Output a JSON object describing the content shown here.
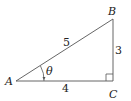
{
  "diagram": {
    "type": "right-triangle",
    "vertices": {
      "A": {
        "label": "A"
      },
      "B": {
        "label": "B"
      },
      "C": {
        "label": "C"
      }
    },
    "sides": {
      "AB": {
        "label": "5"
      },
      "BC": {
        "label": "3"
      },
      "AC": {
        "label": "4"
      }
    },
    "angle": {
      "label": "θ",
      "vertex": "A"
    },
    "right_angle_at": "C",
    "colors": {
      "stroke": "#555555",
      "text": "#222222"
    }
  }
}
